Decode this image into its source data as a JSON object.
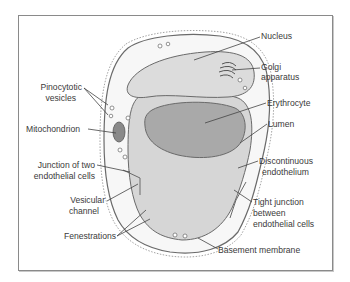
{
  "figure": {
    "labels": {
      "nucleus": "Nucleus",
      "golgi_1": "Golgi",
      "golgi_2": "apparatus",
      "pinocytotic_1": "Pinocytotic",
      "pinocytotic_2": "vesicles",
      "erythrocyte": "Erythrocyte",
      "mitochondrion": "Mitochondrion",
      "lumen": "Lumen",
      "junction_1": "Junction of two",
      "junction_2": "endothelial cells",
      "discontinuous_1": "Discontinuous",
      "discontinuous_2": "endothelium",
      "vesicular_1": "Vesicular",
      "vesicular_2": "channel",
      "tight_1": "Tight junction",
      "tight_2": "between",
      "tight_3": "endothelial cells",
      "fenestrations": "Fenestrations",
      "basement": "Basement membrane"
    },
    "colors": {
      "frame": "#8a8a8a",
      "cytoplasm": "#f7f7f7",
      "lumen": "#d6d6d6",
      "nucleus": "#dcdcdc",
      "erythrocyte": "#a9a9a9",
      "outline": "#6a6a6a",
      "text": "#3a3a3a"
    }
  }
}
